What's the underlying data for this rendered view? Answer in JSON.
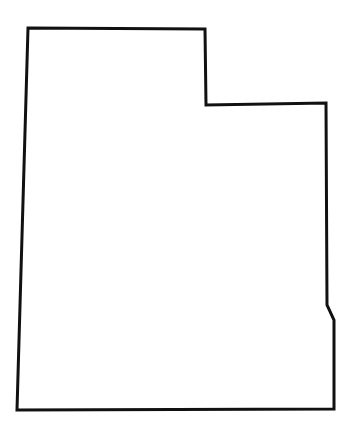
{
  "map": {
    "region": "Utah",
    "style": {
      "background": "#ffffff",
      "stroke": "#111111",
      "fill": "#ffffff",
      "stroke_width": 3
    },
    "outline_points": [
      [
        28,
        28
      ],
      [
        205,
        29
      ],
      [
        206,
        105
      ],
      [
        326,
        103
      ],
      [
        327,
        305
      ],
      [
        334,
        320
      ],
      [
        334,
        409
      ],
      [
        17,
        410
      ]
    ]
  }
}
